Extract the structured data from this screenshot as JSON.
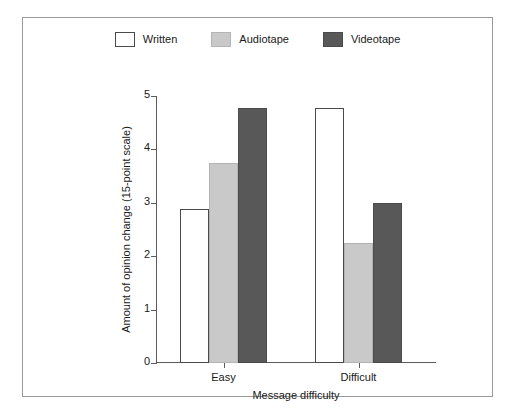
{
  "chart_data": {
    "type": "bar",
    "title": "",
    "subtitle": "",
    "xlabel": "Message difficulty",
    "ylabel": "Amount of opinion change (15-point scale)",
    "categories": [
      "Easy",
      "Difficult"
    ],
    "series": [
      {
        "name": "Written",
        "values": [
          2.88,
          4.78
        ],
        "color": "#ffffff",
        "border": "#4a4a4a"
      },
      {
        "name": "Audiotape",
        "values": [
          3.75,
          2.25
        ],
        "color": "#c9c9c9",
        "border": "#b4b4b4"
      },
      {
        "name": "Videotape",
        "values": [
          4.78,
          3.0
        ],
        "color": "#585858",
        "border": "#4b4b4b"
      }
    ],
    "ylim": [
      0,
      5
    ],
    "yticks": [
      0,
      1,
      2,
      3,
      4,
      5
    ],
    "ytick_labels": [
      "0",
      "1",
      "2",
      "3",
      "4",
      "5"
    ],
    "grid": false,
    "legend_position": "top-center",
    "frame": true
  },
  "legend": {
    "items": [
      {
        "label": "Written",
        "swatch": "legend-swatch-written"
      },
      {
        "label": "Audiotape",
        "swatch": "legend-swatch-audiotape"
      },
      {
        "label": "Videotape",
        "swatch": "legend-swatch-videotape"
      }
    ]
  },
  "axes": {
    "y_title": "Amount of opinion change (15-point scale)",
    "x_title": "Message difficulty",
    "y_labels": [
      "5",
      "4",
      "3",
      "2",
      "1",
      "0"
    ],
    "x_labels": [
      "Easy",
      "Difficult"
    ]
  }
}
